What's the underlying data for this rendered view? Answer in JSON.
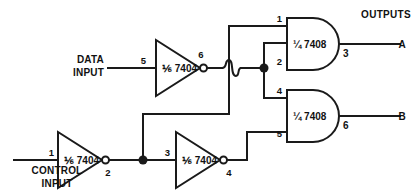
{
  "diagram": {
    "outputs_group_label": "OUTPUTS"
  },
  "inputs": [
    {
      "id": "data-input",
      "label_line1": "DATA",
      "label_line2": "INPUT"
    },
    {
      "id": "control-input",
      "label_line1": "CONTROL",
      "label_line2": "INPUT"
    }
  ],
  "gates": [
    {
      "id": "inverter-data",
      "type": "inverter",
      "chip_label": "⅙ 7404",
      "input_pin": "5",
      "output_pin": "6"
    },
    {
      "id": "inverter-control",
      "type": "inverter",
      "chip_label": "⅙ 7404",
      "input_pin": "1",
      "output_pin": "2"
    },
    {
      "id": "inverter-control-2",
      "type": "inverter",
      "chip_label": "⅙ 7404",
      "input_pin": "3",
      "output_pin": "4"
    },
    {
      "id": "and-gate-a",
      "type": "and",
      "chip_label": "¼ 7408",
      "input_pin_top": "1",
      "input_pin_bottom": "2",
      "output_pin": "3"
    },
    {
      "id": "and-gate-b",
      "type": "and",
      "chip_label": "¼ 7408",
      "input_pin_top": "4",
      "input_pin_bottom": "5",
      "output_pin": "6"
    }
  ],
  "outputs": [
    {
      "id": "output-a",
      "label": "A"
    },
    {
      "id": "output-b",
      "label": "B"
    }
  ],
  "colors": {
    "wire": "#1a1a1a",
    "background": "#ffffff",
    "text": "#111111"
  }
}
